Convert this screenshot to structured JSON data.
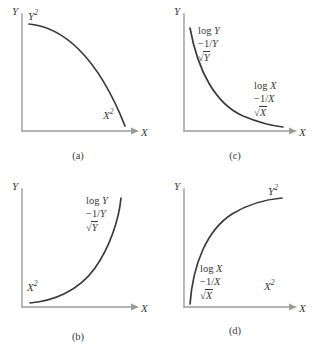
{
  "figure": {
    "type": "four-panel-curve-diagram",
    "panel_count": 4,
    "axis_color": "#9c9c9c",
    "curve_color": "#3a3a3a",
    "background": "#ffffff"
  },
  "panels": [
    {
      "id": "a",
      "caption": "(a)",
      "y_axis_label": "Y",
      "x_axis_label": "X",
      "curve_shape": "concave-decreasing-quarter-circle",
      "labels": [
        {
          "name": "y-power-label",
          "base": "Y",
          "exponent": "2"
        },
        {
          "name": "x-power-label",
          "base": "X",
          "exponent": "2"
        }
      ]
    },
    {
      "id": "c",
      "caption": "(c)",
      "y_axis_label": "Y",
      "x_axis_label": "X",
      "curve_shape": "convex-decreasing-hyperbolic",
      "ladders": [
        {
          "name": "y-ladder",
          "rows": [
            {
              "fn": "log",
              "var": "Y"
            },
            {
              "neg": "−1/",
              "var": "Y"
            },
            {
              "sqrt": true,
              "var": "Y"
            }
          ]
        },
        {
          "name": "x-ladder",
          "rows": [
            {
              "fn": "log",
              "var": "X"
            },
            {
              "neg": "−1/",
              "var": "X"
            },
            {
              "sqrt": true,
              "var": "X"
            }
          ]
        }
      ]
    },
    {
      "id": "b",
      "caption": "(b)",
      "y_axis_label": "Y",
      "x_axis_label": "X",
      "curve_shape": "convex-increasing-exponential",
      "labels": [
        {
          "name": "x-power-label",
          "base": "X",
          "exponent": "2"
        }
      ],
      "ladders": [
        {
          "name": "y-ladder",
          "rows": [
            {
              "fn": "log",
              "var": "Y"
            },
            {
              "neg": "−1/",
              "var": "Y"
            },
            {
              "sqrt": true,
              "var": "Y"
            }
          ]
        }
      ]
    },
    {
      "id": "d",
      "caption": "(d)",
      "y_axis_label": "Y",
      "x_axis_label": "X",
      "curve_shape": "concave-increasing-logarithmic",
      "labels": [
        {
          "name": "y-power-label",
          "base": "Y",
          "exponent": "2"
        },
        {
          "name": "x-power-label",
          "base": "X",
          "exponent": "2"
        }
      ],
      "ladders": [
        {
          "name": "x-ladder",
          "rows": [
            {
              "fn": "log",
              "var": "X"
            },
            {
              "neg": "−1/",
              "var": "X"
            },
            {
              "sqrt": true,
              "var": "X"
            }
          ]
        }
      ]
    }
  ],
  "glyphs": {
    "log": "log",
    "neg_recip": "−1/",
    "sqrt": "√",
    "exponent_two": "2",
    "var_x": "X",
    "var_y": "Y"
  },
  "captions": {
    "a": "(a)",
    "b": "(b)",
    "c": "(c)",
    "d": "(d)"
  }
}
